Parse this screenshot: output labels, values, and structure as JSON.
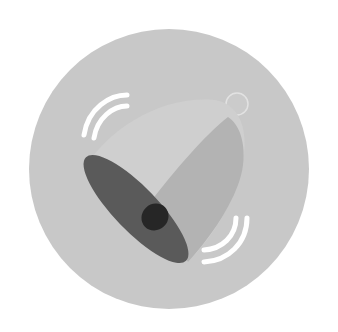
{
  "icon": {
    "name": "ringing-bell-icon",
    "colors": {
      "page_background": "#ffffff",
      "circle_background": "#c8c8c8",
      "bell_light": "#d3d3d3",
      "bell_shadow": "#b4b4b4",
      "bell_mouth": "#5c5c5c",
      "clapper": "#2a2a2a",
      "handle_ring": "#c2c2c2",
      "vibration_lines": "#ffffff"
    }
  }
}
